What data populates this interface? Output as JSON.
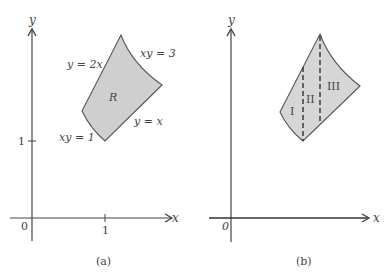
{
  "panels": [
    {
      "id": "a",
      "caption": "(a)",
      "axis_x_label": "x",
      "axis_y_label": "y",
      "origin_label": "0",
      "tick_x_label": "1",
      "tick_y_label": "1",
      "region_label": "R",
      "curve_labels": {
        "y2x": "y = 2x",
        "xy3": "xy = 3",
        "yx": "y = x",
        "xy1": "xy = 1"
      }
    },
    {
      "id": "b",
      "caption": "(b)",
      "axis_x_label": "x",
      "axis_y_label": "y",
      "origin_label": "0",
      "subregion_labels": [
        "I",
        "II",
        "III"
      ]
    }
  ],
  "colors": {
    "fill": "#cfcfcf",
    "stroke": "#555555",
    "axis": "#444444",
    "text": "#444444"
  }
}
